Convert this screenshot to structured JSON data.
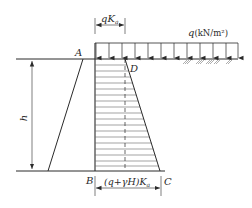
{
  "diagram": {
    "labels": {
      "A": "A",
      "B": "B",
      "C": "C",
      "D": "D",
      "h": "h",
      "top_width": "qK",
      "top_width_sub": "a",
      "bottom_width": "(q+γH)K",
      "bottom_width_sub": "a",
      "load": "q",
      "load_unit": "(kN/m²)"
    },
    "colors": {
      "line": "#2a2a2a",
      "hatch": "#555555",
      "background": "#ffffff"
    },
    "load_arrow_count": 12,
    "hatch_line_count": 19
  }
}
